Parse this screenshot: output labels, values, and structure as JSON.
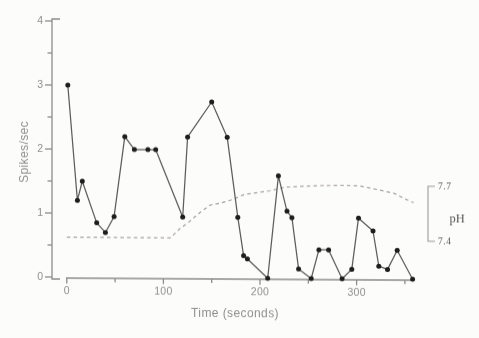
{
  "chart_data": {
    "type": "line",
    "title": "",
    "xlabel": "Time (seconds)",
    "ylabel": "Spikes/sec",
    "xlim": [
      0,
      360
    ],
    "ylim": [
      0,
      4
    ],
    "grid": false,
    "x_axis_end": 358,
    "x_major_ticks": [
      0,
      100,
      200,
      300
    ],
    "x_minor_ticks": [
      50,
      150,
      250,
      350
    ],
    "x_tick_labels": [
      "0",
      "100",
      "200",
      "300"
    ],
    "y_major_ticks": [
      4,
      3,
      2,
      1,
      0
    ],
    "y_minor_ticks": [
      3.5,
      2.5,
      1.5,
      0.5
    ],
    "y_tick_labels": [
      "4",
      "3",
      "2",
      "1",
      "0"
    ],
    "series": [
      {
        "name": "spike-rate",
        "style": "solid",
        "marker": "filled-circle",
        "x": [
          1,
          11,
          16,
          31,
          40,
          49,
          60,
          70,
          84,
          92,
          120,
          125,
          150,
          166,
          177,
          183,
          187,
          208,
          219,
          228,
          233,
          240,
          253,
          261,
          271,
          285,
          295,
          302,
          317,
          323,
          332,
          342,
          358
        ],
        "y": [
          3.0,
          1.2,
          1.5,
          0.85,
          0.7,
          0.95,
          2.2,
          2.0,
          2.0,
          2.0,
          0.95,
          2.2,
          2.75,
          2.2,
          0.95,
          0.35,
          0.3,
          0.0,
          1.6,
          1.05,
          0.95,
          0.15,
          0.0,
          0.45,
          0.45,
          0.0,
          0.15,
          0.95,
          0.75,
          0.2,
          0.15,
          0.45,
          0.0
        ]
      },
      {
        "name": "pH",
        "style": "dashed",
        "axis": "right",
        "x": [
          0,
          40,
          80,
          107,
          117,
          127,
          138,
          148,
          158,
          171,
          184,
          198,
          210,
          226,
          241,
          262,
          283,
          303,
          322,
          339,
          350,
          359
        ],
        "y": [
          7.41,
          7.41,
          7.41,
          7.41,
          7.46,
          7.5,
          7.55,
          7.59,
          7.6,
          7.62,
          7.65,
          7.66,
          7.67,
          7.69,
          7.695,
          7.7,
          7.703,
          7.7,
          7.68,
          7.66,
          7.63,
          7.61
        ]
      }
    ],
    "right_axis": {
      "title": "pH",
      "top_label": "7.7",
      "bottom_label": "7.4",
      "ticks": [
        7.7,
        7.4
      ]
    },
    "colors": {
      "axis": "#8d8d8d",
      "text": "#8f8f8f",
      "line": "#5c5c5c",
      "marker": "#1e1e1e",
      "dashed": "#a9a39c",
      "bracket": "#9a9a9a",
      "rtext": "#575757",
      "background": "#fcfcfb"
    }
  }
}
